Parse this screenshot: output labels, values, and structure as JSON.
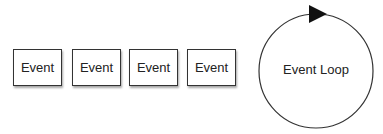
{
  "diagram": {
    "queue": {
      "events": [
        {
          "label": "Event"
        },
        {
          "label": "Event"
        },
        {
          "label": "Event"
        },
        {
          "label": "Event"
        }
      ]
    },
    "loop": {
      "label": "Event Loop",
      "arrow_direction": "clockwise"
    },
    "colors": {
      "stroke": "#333333",
      "text": "#222222",
      "background": "#ffffff"
    }
  }
}
